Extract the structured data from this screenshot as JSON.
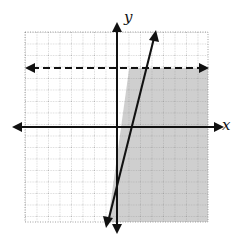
{
  "graph": {
    "type": "linear-inequality-system",
    "axis_labels": {
      "x": "x",
      "y": "y"
    },
    "grid": {
      "left": 25,
      "top": 32,
      "right": 208,
      "bottom": 222,
      "spacing": 11.5
    },
    "origin_px": {
      "x": 117,
      "y": 127
    },
    "colors": {
      "shade": "#cfcfcf",
      "line": "#111111",
      "grid": "#9a9a9a",
      "background": "#ffffff"
    },
    "boundaries": [
      {
        "name": "horizontal-dashed-line",
        "style": "dashed",
        "y_px": 68
      },
      {
        "name": "slanted-solid-line",
        "style": "solid",
        "from_px": [
          107,
          226
        ],
        "to_px": [
          156,
          30
        ]
      }
    ],
    "shaded_region": "below dashed line and right of slanted line"
  }
}
